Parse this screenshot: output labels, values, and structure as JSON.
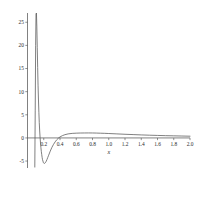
{
  "chart_data": {
    "type": "line",
    "title": "",
    "subtitle": "",
    "xlabel": "x",
    "ylabel": "",
    "xlim": [
      0.0,
      2.0
    ],
    "ylim": [
      -6.5,
      27.0
    ],
    "grid": false,
    "legend": null,
    "x_ticks": [
      0.2,
      0.4,
      0.6,
      0.8,
      1.0,
      1.2,
      1.4,
      1.6,
      1.8,
      2.0
    ],
    "x_tick_labels": [
      "0.2",
      "0.4",
      "0.6",
      "0.8",
      "1.0",
      "1.2",
      "1.4",
      "1.6",
      "1.8",
      "2.0"
    ],
    "y_ticks": [
      -5,
      0,
      5,
      10,
      15,
      20,
      25
    ],
    "y_tick_labels": [
      "-5",
      "0",
      "5",
      "10",
      "15",
      "20",
      "25"
    ],
    "series": [
      {
        "name": "curve",
        "color": "#555555",
        "x": [
          0.09,
          0.095,
          0.1,
          0.105,
          0.11,
          0.115,
          0.12,
          0.125,
          0.13,
          0.135,
          0.14,
          0.145,
          0.15,
          0.155,
          0.16,
          0.165,
          0.17,
          0.175,
          0.18,
          0.185,
          0.19,
          0.195,
          0.2,
          0.21,
          0.22,
          0.23,
          0.24,
          0.25,
          0.26,
          0.28,
          0.3,
          0.32,
          0.34,
          0.36,
          0.38,
          0.4,
          0.43,
          0.46,
          0.5,
          0.55,
          0.6,
          0.65,
          0.7,
          0.75,
          0.8,
          0.85,
          0.9,
          0.95,
          1.0,
          1.1,
          1.2,
          1.3,
          1.4,
          1.5,
          1.6,
          1.7,
          1.8,
          1.9,
          2.0
        ],
        "y": [
          -6.3,
          6.0,
          20.0,
          26.8,
          27.0,
          24.0,
          19.5,
          15.2,
          11.4,
          8.2,
          5.5,
          3.3,
          1.5,
          0.1,
          -1.1,
          -2.1,
          -2.9,
          -3.6,
          -4.2,
          -4.7,
          -5.0,
          -5.3,
          -5.45,
          -5.5,
          -5.35,
          -5.05,
          -4.65,
          -4.2,
          -3.75,
          -2.85,
          -2.05,
          -1.4,
          -0.85,
          -0.4,
          -0.05,
          0.22,
          0.5,
          0.7,
          0.87,
          0.98,
          1.03,
          1.06,
          1.07,
          1.075,
          1.07,
          1.05,
          1.02,
          0.99,
          0.95,
          0.87,
          0.79,
          0.72,
          0.65,
          0.59,
          0.54,
          0.49,
          0.45,
          0.41,
          0.37
        ]
      }
    ]
  },
  "axes": {
    "x_axis_name": "x-axis",
    "y_axis_name": "y-axis"
  }
}
